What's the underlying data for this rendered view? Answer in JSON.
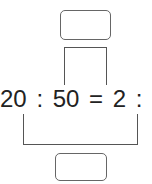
{
  "equation": {
    "left_a": "20",
    "sep1": ":",
    "left_b": "50",
    "equals": "=",
    "right_a": "2",
    "sep2": ":",
    "right_b": "5"
  },
  "top_box": {
    "value": ""
  },
  "bottom_box": {
    "value": ""
  }
}
